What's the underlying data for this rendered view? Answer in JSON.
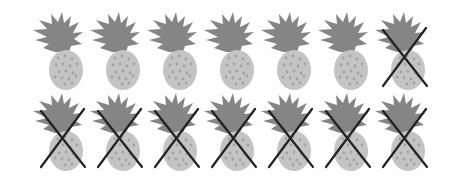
{
  "figure": {
    "description": "Two rows of pineapple icons; crossed-out pineapples are marked with an X",
    "icon": "pineapple-icon",
    "cross_mark": "x-mark-icon",
    "colors": {
      "crown": "#858585",
      "body": "#c4c4c4",
      "speckle": "#a2a2a2",
      "cross": "#222222",
      "background": "#ffffff"
    },
    "rows": [
      {
        "label": "row-1",
        "items": [
          {
            "crossed": false
          },
          {
            "crossed": false
          },
          {
            "crossed": false
          },
          {
            "crossed": false
          },
          {
            "crossed": false
          },
          {
            "crossed": false
          },
          {
            "crossed": true
          }
        ]
      },
      {
        "label": "row-2",
        "items": [
          {
            "crossed": true
          },
          {
            "crossed": true
          },
          {
            "crossed": true
          },
          {
            "crossed": true
          },
          {
            "crossed": true
          },
          {
            "crossed": true
          },
          {
            "crossed": true
          }
        ]
      }
    ],
    "counts": {
      "total": 14,
      "crossed": 8,
      "remaining": 6
    }
  }
}
